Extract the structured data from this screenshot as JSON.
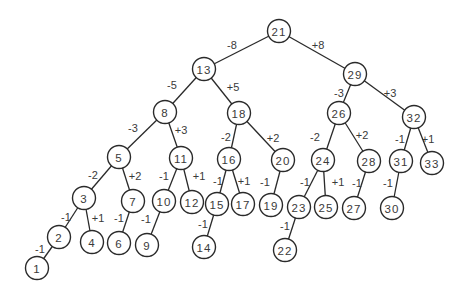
{
  "diagram": {
    "type": "binary-search-tree",
    "style": {
      "line_color": "#2a2a2a",
      "text_color": "#3a3a3a",
      "node_fill": "#ffffff",
      "node_radius": 11.5
    },
    "nodes": [
      {
        "id": "n21",
        "label": "21",
        "x": 279,
        "y": 31
      },
      {
        "id": "n13",
        "label": "13",
        "x": 204,
        "y": 69
      },
      {
        "id": "n29",
        "label": "29",
        "x": 355,
        "y": 74
      },
      {
        "id": "n8",
        "label": "8",
        "x": 165,
        "y": 112
      },
      {
        "id": "n18",
        "label": "18",
        "x": 239,
        "y": 113
      },
      {
        "id": "n26",
        "label": "26",
        "x": 339,
        "y": 113
      },
      {
        "id": "n32",
        "label": "32",
        "x": 414,
        "y": 117
      },
      {
        "id": "n5",
        "label": "5",
        "x": 119,
        "y": 157
      },
      {
        "id": "n11",
        "label": "11",
        "x": 181,
        "y": 158
      },
      {
        "id": "n16",
        "label": "16",
        "x": 229,
        "y": 159
      },
      {
        "id": "n20",
        "label": "20",
        "x": 283,
        "y": 160
      },
      {
        "id": "n24",
        "label": "24",
        "x": 323,
        "y": 160
      },
      {
        "id": "n28",
        "label": "28",
        "x": 369,
        "y": 161
      },
      {
        "id": "n31",
        "label": "31",
        "x": 401,
        "y": 161
      },
      {
        "id": "n33",
        "label": "33",
        "x": 432,
        "y": 163
      },
      {
        "id": "n3",
        "label": "3",
        "x": 84,
        "y": 198
      },
      {
        "id": "n7",
        "label": "7",
        "x": 133,
        "y": 201
      },
      {
        "id": "n10",
        "label": "10",
        "x": 164,
        "y": 201
      },
      {
        "id": "n12",
        "label": "12",
        "x": 192,
        "y": 202
      },
      {
        "id": "n15",
        "label": "15",
        "x": 217,
        "y": 204
      },
      {
        "id": "n17",
        "label": "17",
        "x": 243,
        "y": 204
      },
      {
        "id": "n19",
        "label": "19",
        "x": 271,
        "y": 205
      },
      {
        "id": "n23",
        "label": "23",
        "x": 299,
        "y": 207
      },
      {
        "id": "n25",
        "label": "25",
        "x": 326,
        "y": 207
      },
      {
        "id": "n27",
        "label": "27",
        "x": 354,
        "y": 208
      },
      {
        "id": "n30",
        "label": "30",
        "x": 392,
        "y": 208
      },
      {
        "id": "n2",
        "label": "2",
        "x": 59,
        "y": 237
      },
      {
        "id": "n4",
        "label": "4",
        "x": 92,
        "y": 242
      },
      {
        "id": "n6",
        "label": "6",
        "x": 119,
        "y": 243
      },
      {
        "id": "n9",
        "label": "9",
        "x": 147,
        "y": 245
      },
      {
        "id": "n14",
        "label": "14",
        "x": 204,
        "y": 247
      },
      {
        "id": "n22",
        "label": "22",
        "x": 285,
        "y": 250
      },
      {
        "id": "n1",
        "label": "1",
        "x": 37,
        "y": 268
      }
    ],
    "edges": [
      {
        "from": "n21",
        "to": "n13",
        "label": "-8",
        "lx": 232,
        "ly": 45
      },
      {
        "from": "n21",
        "to": "n29",
        "label": "+8",
        "lx": 318,
        "ly": 45
      },
      {
        "from": "n13",
        "to": "n8",
        "label": "-5",
        "lx": 172,
        "ly": 85
      },
      {
        "from": "n13",
        "to": "n18",
        "label": "+5",
        "lx": 233,
        "ly": 87
      },
      {
        "from": "n29",
        "to": "n26",
        "label": "-3",
        "lx": 339,
        "ly": 93
      },
      {
        "from": "n29",
        "to": "n32",
        "label": "+3",
        "lx": 390,
        "ly": 93
      },
      {
        "from": "n8",
        "to": "n5",
        "label": "-3",
        "lx": 133,
        "ly": 128
      },
      {
        "from": "n8",
        "to": "n11",
        "label": "+3",
        "lx": 181,
        "ly": 130
      },
      {
        "from": "n18",
        "to": "n16",
        "label": "-2",
        "lx": 226,
        "ly": 137
      },
      {
        "from": "n18",
        "to": "n20",
        "label": "+2",
        "lx": 273,
        "ly": 138
      },
      {
        "from": "n26",
        "to": "n24",
        "label": "-2",
        "lx": 315,
        "ly": 137
      },
      {
        "from": "n26",
        "to": "n28",
        "label": "+2",
        "lx": 362,
        "ly": 135
      },
      {
        "from": "n32",
        "to": "n31",
        "label": "-1",
        "lx": 400,
        "ly": 139
      },
      {
        "from": "n32",
        "to": "n33",
        "label": "+1",
        "lx": 428,
        "ly": 139
      },
      {
        "from": "n5",
        "to": "n3",
        "label": "-2",
        "lx": 93,
        "ly": 175
      },
      {
        "from": "n5",
        "to": "n7",
        "label": "+2",
        "lx": 135,
        "ly": 176
      },
      {
        "from": "n11",
        "to": "n10",
        "label": "-1",
        "lx": 164,
        "ly": 176
      },
      {
        "from": "n11",
        "to": "n12",
        "label": "+1",
        "lx": 199,
        "ly": 176
      },
      {
        "from": "n16",
        "to": "n15",
        "label": "-1",
        "lx": 218,
        "ly": 181
      },
      {
        "from": "n16",
        "to": "n17",
        "label": "+1",
        "lx": 244,
        "ly": 181
      },
      {
        "from": "n20",
        "to": "n19",
        "label": "-1",
        "lx": 265,
        "ly": 182
      },
      {
        "from": "n24",
        "to": "n23",
        "label": "-1",
        "lx": 305,
        "ly": 182
      },
      {
        "from": "n24",
        "to": "n25",
        "label": "+1",
        "lx": 338,
        "ly": 182
      },
      {
        "from": "n28",
        "to": "n27",
        "label": "-1",
        "lx": 357,
        "ly": 183
      },
      {
        "from": "n31",
        "to": "n30",
        "label": "-1",
        "lx": 388,
        "ly": 183
      },
      {
        "from": "n3",
        "to": "n2",
        "label": "-1",
        "lx": 66,
        "ly": 217
      },
      {
        "from": "n3",
        "to": "n4",
        "label": "+1",
        "lx": 98,
        "ly": 218
      },
      {
        "from": "n7",
        "to": "n6",
        "label": "-1",
        "lx": 119,
        "ly": 218
      },
      {
        "from": "n10",
        "to": "n9",
        "label": "-1",
        "lx": 146,
        "ly": 219
      },
      {
        "from": "n15",
        "to": "n14",
        "label": "-1",
        "lx": 203,
        "ly": 224
      },
      {
        "from": "n23",
        "to": "n22",
        "label": "-1",
        "lx": 285,
        "ly": 226
      },
      {
        "from": "n2",
        "to": "n1",
        "label": "-1",
        "lx": 40,
        "ly": 249
      }
    ]
  }
}
